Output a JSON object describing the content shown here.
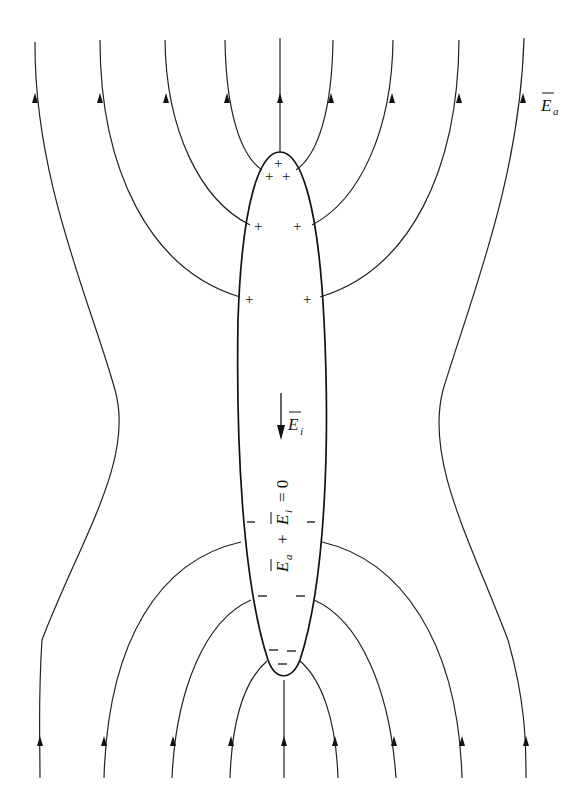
{
  "diagram": {
    "labels": {
      "applied_field": "E",
      "applied_field_sub": "a",
      "induced_field": "E",
      "induced_field_sub": "i",
      "equation_part1": "E",
      "equation_sub_a": "a",
      "equation_plus": "+",
      "equation_part2": "E",
      "equation_sub_i": "i",
      "equation_rest": "= 0"
    },
    "charges": {
      "positive": "+",
      "negative": "–"
    },
    "field_direction": "upward",
    "induced_field_direction": "downward",
    "colors": {
      "background": "#ffffff",
      "ink": "#111111"
    }
  }
}
